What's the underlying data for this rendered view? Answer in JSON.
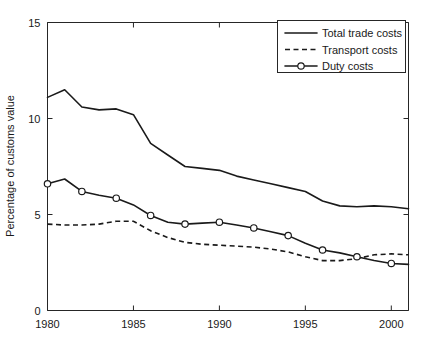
{
  "chart_data": {
    "type": "line",
    "title": "",
    "xlabel": "",
    "ylabel": "Percentage of customs value",
    "xlim": [
      1980,
      2001
    ],
    "ylim": [
      0,
      15
    ],
    "yticks": [
      0,
      5,
      10,
      15
    ],
    "ytick_labels": [
      "0",
      "5",
      "10",
      "15"
    ],
    "xticks": [
      1980,
      1985,
      1990,
      1995,
      2000
    ],
    "xtick_labels": [
      "1980",
      "1985",
      "1990",
      "1995",
      "2000"
    ],
    "grid": false,
    "legend_position": "top-right",
    "x": [
      1980,
      1981,
      1982,
      1983,
      1984,
      1985,
      1986,
      1987,
      1988,
      1989,
      1990,
      1991,
      1992,
      1993,
      1994,
      1995,
      1996,
      1997,
      1998,
      1999,
      2000,
      2001
    ],
    "series": [
      {
        "name": "Total trade costs",
        "style": "solid",
        "marker": "none",
        "color": "#1a1a1a",
        "values": [
          11.1,
          11.5,
          10.6,
          10.45,
          10.5,
          10.2,
          8.7,
          8.1,
          7.5,
          7.4,
          7.3,
          7.0,
          6.8,
          6.6,
          6.4,
          6.2,
          5.7,
          5.45,
          5.4,
          5.45,
          5.4,
          5.3
        ]
      },
      {
        "name": "Transport costs",
        "style": "dashed",
        "marker": "none",
        "color": "#1a1a1a",
        "values": [
          4.5,
          4.45,
          4.45,
          4.5,
          4.65,
          4.65,
          4.15,
          3.8,
          3.55,
          3.45,
          3.4,
          3.35,
          3.3,
          3.2,
          3.05,
          2.8,
          2.6,
          2.6,
          2.7,
          2.9,
          2.95,
          2.9
        ]
      },
      {
        "name": "Duty costs",
        "style": "solid",
        "marker": "circle",
        "color": "#1a1a1a",
        "values": [
          6.6,
          6.85,
          6.2,
          6.0,
          5.85,
          5.5,
          4.95,
          4.6,
          4.5,
          4.55,
          4.6,
          4.45,
          4.3,
          4.1,
          3.9,
          3.5,
          3.15,
          3.0,
          2.8,
          2.6,
          2.45,
          2.4
        ],
        "marker_years": [
          1980,
          1982,
          1984,
          1986,
          1988,
          1990,
          1992,
          1994,
          1996,
          1998,
          2000
        ]
      }
    ],
    "legend": [
      {
        "label": "Total trade costs",
        "style": "solid",
        "marker": "none"
      },
      {
        "label": "Transport costs",
        "style": "dashed",
        "marker": "none"
      },
      {
        "label": "Duty costs",
        "style": "solid",
        "marker": "circle"
      }
    ]
  }
}
